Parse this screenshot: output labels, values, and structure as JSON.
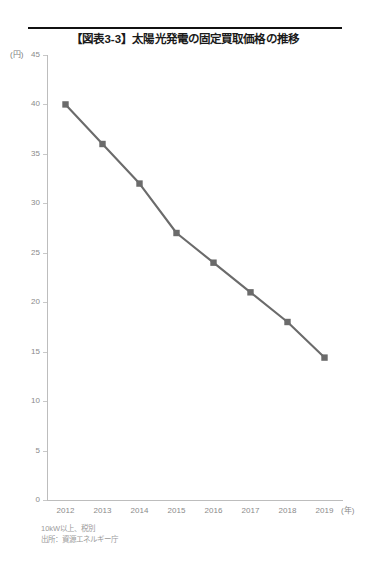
{
  "figure": {
    "title": "【図表3-3】太陽光発電の固定買取価格の推移",
    "y_unit_label": "(円)",
    "x_unit_label": "(年)",
    "note_condition": "10kW以上、税別",
    "note_source": "出所：資源エネルギー庁",
    "line_color": "#6b6b6b",
    "marker_color": "#6b6b6b",
    "axis_color": "#bdbdbd",
    "tick_label_color": "#8a8a8a",
    "rule_color": "#111111"
  },
  "chart_data": {
    "type": "line",
    "title": "【図表3-3】太陽光発電の固定買取価格の推移",
    "xlabel": "(年)",
    "ylabel": "(円)",
    "categories": [
      "2012",
      "2013",
      "2014",
      "2015",
      "2016",
      "2017",
      "2018",
      "2019"
    ],
    "values": [
      40,
      36,
      32,
      27,
      24,
      21,
      18,
      14.4
    ],
    "ylim": [
      0,
      45
    ],
    "y_ticks": [
      0,
      5,
      10,
      15,
      20,
      25,
      30,
      35,
      40,
      45
    ],
    "y_tick_labels": [
      "0",
      "5",
      "10",
      "15",
      "20",
      "25",
      "30",
      "35",
      "40",
      "45"
    ],
    "x_tick_labels": [
      "2012",
      "2013",
      "2014",
      "2015",
      "2016",
      "2017",
      "2018",
      "2019"
    ],
    "grid": false,
    "legend": "none",
    "marker": "square",
    "series": [
      {
        "name": "固定買取価格",
        "values": [
          40,
          36,
          32,
          27,
          24,
          21,
          18,
          14.4
        ]
      }
    ],
    "annotations": [
      "10kW以上、税別",
      "出所：資源エネルギー庁"
    ]
  }
}
